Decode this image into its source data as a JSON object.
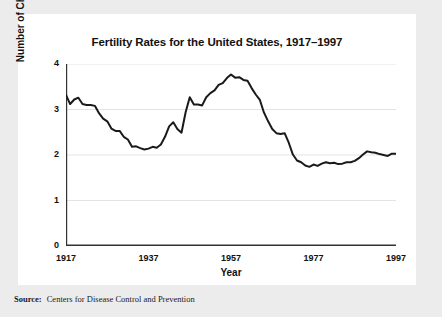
{
  "figure": {
    "source_label": "Source:",
    "source_text": "Centers for Disease Control and Prevention"
  },
  "chart_data": {
    "type": "line",
    "title": "Fertility Rates for the United States, 1917–1997",
    "xlabel": "Year",
    "ylabel": "Number of Children per Woman",
    "xlim": [
      1917,
      1997
    ],
    "ylim": [
      0,
      4
    ],
    "xticks": [
      1917,
      1937,
      1957,
      1977,
      1997
    ],
    "xtick_labels": [
      "1917",
      "1937",
      "1957",
      "1977",
      "1997"
    ],
    "yticks": [
      0,
      1,
      2,
      3,
      4
    ],
    "ytick_labels": [
      "0",
      "1",
      "2",
      "3",
      "4"
    ],
    "yminor_ticks": [
      0.5,
      1.5,
      2.5,
      3.5
    ],
    "grid": "horizontal",
    "gridlines_at": [
      1,
      2,
      3,
      4
    ],
    "legend": null,
    "line_color": "#1a1a1a",
    "line_width": 2,
    "grid_color": "#e3e3e3",
    "axis_color": "#333333",
    "x": [
      1917,
      1918,
      1919,
      1920,
      1921,
      1922,
      1923,
      1924,
      1925,
      1926,
      1927,
      1928,
      1929,
      1930,
      1931,
      1932,
      1933,
      1934,
      1935,
      1936,
      1937,
      1938,
      1939,
      1940,
      1941,
      1942,
      1943,
      1944,
      1945,
      1946,
      1947,
      1948,
      1949,
      1950,
      1951,
      1952,
      1953,
      1954,
      1955,
      1956,
      1957,
      1958,
      1959,
      1960,
      1961,
      1962,
      1963,
      1964,
      1965,
      1966,
      1967,
      1968,
      1969,
      1970,
      1971,
      1972,
      1973,
      1974,
      1975,
      1976,
      1977,
      1978,
      1979,
      1980,
      1981,
      1982,
      1983,
      1984,
      1985,
      1986,
      1987,
      1988,
      1989,
      1990,
      1991,
      1992,
      1993,
      1994,
      1995,
      1996,
      1997
    ],
    "values": [
      3.32,
      3.12,
      3.22,
      3.26,
      3.12,
      3.1,
      3.1,
      3.08,
      2.92,
      2.8,
      2.74,
      2.58,
      2.53,
      2.53,
      2.4,
      2.34,
      2.18,
      2.19,
      2.15,
      2.12,
      2.14,
      2.18,
      2.16,
      2.23,
      2.4,
      2.63,
      2.72,
      2.57,
      2.49,
      2.94,
      3.27,
      3.11,
      3.11,
      3.09,
      3.27,
      3.36,
      3.42,
      3.54,
      3.58,
      3.69,
      3.77,
      3.7,
      3.71,
      3.65,
      3.63,
      3.47,
      3.33,
      3.21,
      2.93,
      2.74,
      2.57,
      2.48,
      2.46,
      2.48,
      2.27,
      2.01,
      1.88,
      1.84,
      1.77,
      1.74,
      1.79,
      1.76,
      1.81,
      1.84,
      1.82,
      1.83,
      1.8,
      1.81,
      1.84,
      1.84,
      1.87,
      1.93,
      2.01,
      2.08,
      2.06,
      2.05,
      2.02,
      2.0,
      1.98,
      2.03,
      2.03
    ]
  }
}
